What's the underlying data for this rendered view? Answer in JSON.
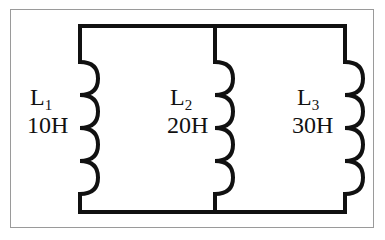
{
  "diagram": {
    "type": "parallel inductor circuit",
    "colors": {
      "wire": "#111111",
      "frame": "#9a9a9a",
      "background": "#ffffff"
    },
    "inductors": [
      {
        "name": "L",
        "subscript": "1",
        "value": "10H"
      },
      {
        "name": "L",
        "subscript": "2",
        "value": "20H"
      },
      {
        "name": "L",
        "subscript": "3",
        "value": "30H"
      }
    ]
  }
}
